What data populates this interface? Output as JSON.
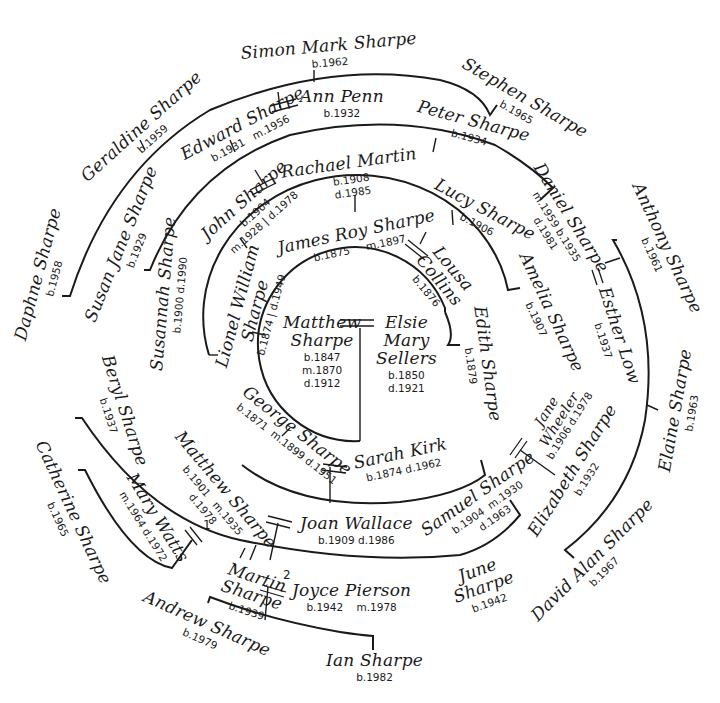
{
  "colors": {
    "ink": "#1a1a1a",
    "paper": "#ffffff"
  },
  "people": {
    "matthew_sr": {
      "name_line1": "Matthew",
      "name_line2": "Sharpe",
      "born": "b.1847",
      "married": "m.1870",
      "died": "d.1912"
    },
    "elsie": {
      "name_line1": "Elsie",
      "name_line2": "Mary",
      "name_line3": "Sellers",
      "born": "b.1850",
      "died": "d.1921"
    },
    "james_roy": {
      "name": "James Roy Sharpe",
      "born": "b.1875",
      "married": "m.1897"
    },
    "louisa": {
      "name_line1": "Lousa",
      "name_line2": "Collins",
      "born": "b.1876"
    },
    "lionel": {
      "name_line1": "Lionel William",
      "name_line2": "Sharpe",
      "born": "b.1874",
      "died": "d.1949"
    },
    "edith": {
      "name": "Edith Sharpe",
      "born": "b.1879"
    },
    "george": {
      "name": "George Sharpe",
      "born": "b.1871",
      "married": "m.1899",
      "died": "d.1951"
    },
    "sarah_kirk": {
      "name": "Sarah Kirk",
      "born": "b.1874",
      "died": "d.1962"
    },
    "john": {
      "name": "John Sharpe",
      "born": "b.1904",
      "died": "d.1978",
      "married": "m.1928"
    },
    "rachael": {
      "name": "Rachael Martin",
      "born": "b.1908",
      "died": "d.1985"
    },
    "lucy": {
      "name": "Lucy Sharpe",
      "born": "b.1906"
    },
    "amelia": {
      "name": "Amelia Sharpe",
      "born": "b.1907"
    },
    "susannah": {
      "name": "Susannah Sharpe",
      "dates": "b.1900 d.1990"
    },
    "matthew_jr": {
      "name": "Matthew Sharpe",
      "born": "b.1901",
      "died": "d.1978",
      "married": "m.1935"
    },
    "joan": {
      "name": "Joan Wallace",
      "dates": "b.1909 d.1986"
    },
    "samuel": {
      "name": "Samuel Sharpe",
      "born": "b.1904",
      "married": "m.1930",
      "died": "d.1963"
    },
    "jane": {
      "name_line1": "Jane",
      "name_line2": "Wheeler",
      "dates": "b.1906 d.1978"
    },
    "edward": {
      "name": "Edward Sharpe",
      "born": "b.1931",
      "married": "m.1956"
    },
    "ann": {
      "name": "Ann Penn",
      "born": "b.1932"
    },
    "peter": {
      "name": "Peter Sharpe",
      "born": "b.1934"
    },
    "susan_jane": {
      "name": "Susan Jane Sharpe",
      "born": "b.1929"
    },
    "daniel": {
      "name": "Daniel Sharpe",
      "born": "b.1935",
      "married": "m.1959",
      "died": "d.1981"
    },
    "esther": {
      "name": "Esther Low",
      "born": "b.1937"
    },
    "beryl": {
      "name": "Beryl Sharpe",
      "born": "b.1937"
    },
    "martin": {
      "name_line1": "Martin",
      "name_line2": "Sharpe",
      "born": "b.1939"
    },
    "mary_watts": {
      "name": "Mary Watts",
      "married": "m.1964",
      "died": "d.1972"
    },
    "joyce": {
      "name": "Joyce Pierson",
      "born": "b.1942",
      "married": "m.1978"
    },
    "june": {
      "name_line1": "June",
      "name_line2": "Sharpe",
      "born": "b.1942"
    },
    "elizabeth": {
      "name": "Elizabeth Sharpe",
      "born": "b.1932"
    },
    "simon": {
      "name": "Simon Mark Sharpe",
      "born": "b.1962"
    },
    "stephen": {
      "name": "Stephen Sharpe",
      "born": "b.1965"
    },
    "geraldine": {
      "name": "Geraldine Sharpe",
      "born": "b.1959"
    },
    "daphne": {
      "name": "Daphne Sharpe",
      "born": "b.1958"
    },
    "anthony": {
      "name": "Anthony Sharpe",
      "born": "b.1961"
    },
    "elaine": {
      "name": "Elaine Sharpe",
      "born": "b.1963"
    },
    "david": {
      "name": "David Alan Sharpe",
      "born": "b.1967"
    },
    "catherine": {
      "name": "Catherine Sharpe",
      "born": "b.1965"
    },
    "andrew": {
      "name": "Andrew Sharpe",
      "born": "b.1979"
    },
    "ian": {
      "name": "Ian Sharpe",
      "born": "b.1982"
    }
  },
  "marriage_numbers": {
    "first": "1",
    "second": "2"
  }
}
